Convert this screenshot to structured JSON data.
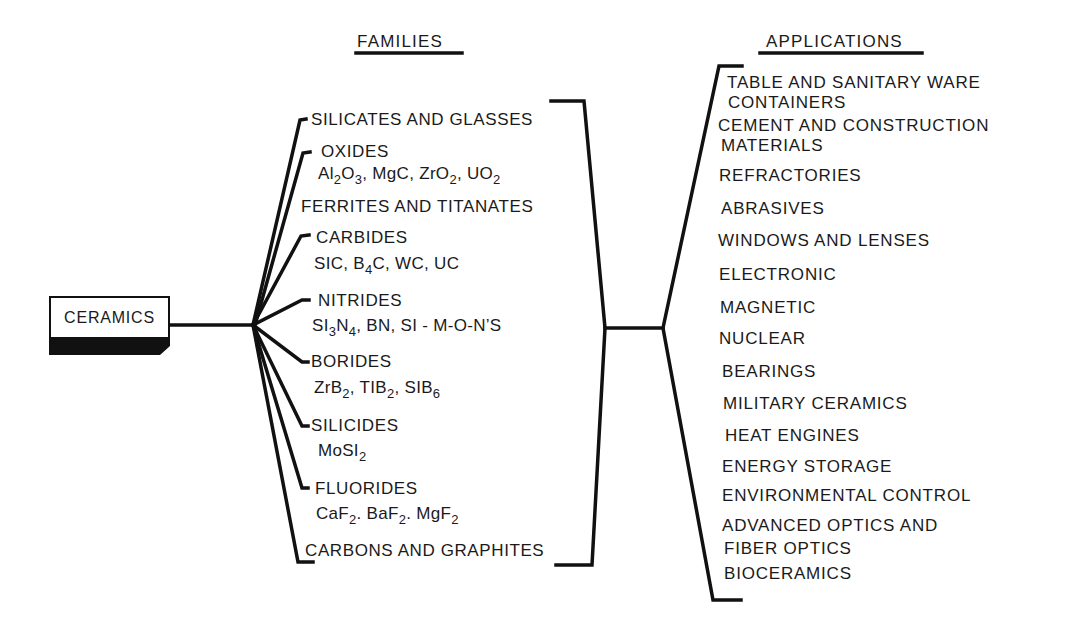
{
  "diagram": {
    "root": {
      "label": "CERAMICS"
    },
    "headers": {
      "families": "FAMILIES",
      "applications": "APPLICATIONS"
    },
    "families": [
      {
        "name": "SILICATES AND GLASSES"
      },
      {
        "name": "OXIDES",
        "examples": [
          "Al2O3",
          "MgC",
          "ZrO2",
          "UO2"
        ]
      },
      {
        "name": "FERRITES AND TITANATES"
      },
      {
        "name": "CARBIDES",
        "examples": [
          "SIC",
          "B4C",
          "WC",
          "UC"
        ]
      },
      {
        "name": "NITRIDES",
        "examples": [
          "SI3N4",
          "BN",
          "SI - M-O-N'S"
        ]
      },
      {
        "name": "BORIDES",
        "examples": [
          "ZrB2",
          "TIB2",
          "SIB6"
        ]
      },
      {
        "name": "SILICIDES",
        "examples": [
          "MoSI2"
        ]
      },
      {
        "name": "FLUORIDES",
        "examples": [
          "CaF2",
          "BaF2",
          "MgF2"
        ]
      },
      {
        "name": "CARBONS AND GRAPHITES"
      }
    ],
    "formula_parts": {
      "oxides": [
        {
          "t": "Al"
        },
        {
          "s": "2"
        },
        {
          "t": "O"
        },
        {
          "s": "3"
        },
        {
          "t": ", MgC, ZrO"
        },
        {
          "s": "2"
        },
        {
          "t": ", UO"
        },
        {
          "s": "2"
        }
      ],
      "carbides": [
        {
          "t": "SIC, B"
        },
        {
          "s": "4"
        },
        {
          "t": "C, WC, UC"
        }
      ],
      "nitrides": [
        {
          "t": "SI"
        },
        {
          "s": "3"
        },
        {
          "t": "N"
        },
        {
          "s": "4"
        },
        {
          "t": ", BN, SI - M-O-N’S"
        }
      ],
      "borides": [
        {
          "t": "ZrB"
        },
        {
          "s": "2"
        },
        {
          "t": ", TIB"
        },
        {
          "s": "2"
        },
        {
          "t": ", SIB"
        },
        {
          "s": "6"
        }
      ],
      "silicides": [
        {
          "t": "MoSI"
        },
        {
          "s": "2"
        }
      ],
      "fluorides": [
        {
          "t": "CaF"
        },
        {
          "s": "2"
        },
        {
          "t": ". BaF"
        },
        {
          "s": "2"
        },
        {
          "t": ". MgF"
        },
        {
          "s": "2"
        }
      ]
    },
    "applications": [
      "TABLE AND SANITARY WARE",
      "CONTAINERS",
      "CEMENT AND CONSTRUCTION",
      "MATERIALS",
      "REFRACTORIES",
      "ABRASIVES",
      "WINDOWS AND LENSES",
      "ELECTRONIC",
      "MAGNETIC",
      "NUCLEAR",
      "BEARINGS",
      "MILITARY CERAMICS",
      "HEAT ENGINES",
      "ENERGY STORAGE",
      "ENVIRONMENTAL CONTROL",
      "ADVANCED OPTICS AND",
      "FIBER OPTICS",
      "BIOCERAMICS"
    ],
    "colors": {
      "ink": "#111111",
      "background": "#ffffff"
    }
  }
}
